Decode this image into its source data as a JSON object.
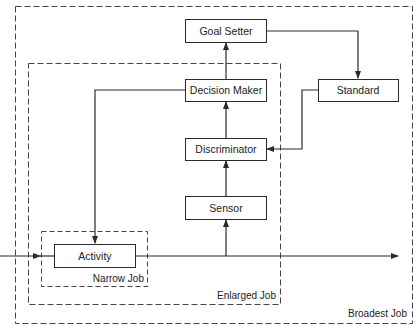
{
  "diagram": {
    "boxes": {
      "goal_setter": "Goal Setter",
      "decision_maker": "Decision Maker",
      "standard": "Standard",
      "discriminator": "Discriminator",
      "sensor": "Sensor",
      "activity": "Activity"
    },
    "regions": {
      "narrow_job": "Narrow Job",
      "enlarged_job": "Enlarged Job",
      "broadest_job": "Broadest Job"
    },
    "colors": {
      "line": "#2a2a2a",
      "background": "#ffffff"
    }
  }
}
